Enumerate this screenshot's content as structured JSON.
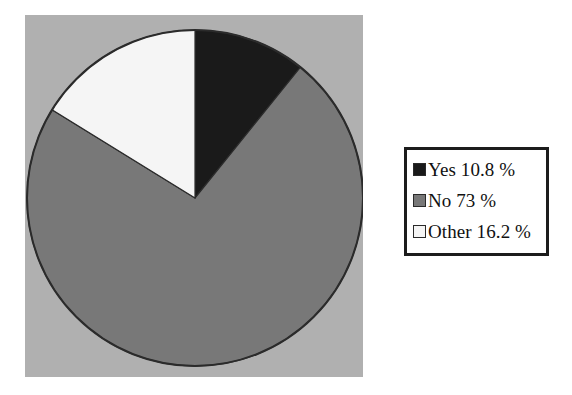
{
  "chart_data": {
    "type": "pie",
    "title": "",
    "subtitle": "",
    "xlabel": "",
    "ylabel": "",
    "grid": false,
    "legend_position": "right",
    "start_angle_deg": 0,
    "direction": "clockwise",
    "categories": [
      "Yes",
      "No",
      "Other"
    ],
    "values": [
      10.8,
      73,
      16.2
    ],
    "value_unit": "%",
    "slices": [
      {
        "label": "Yes",
        "value": 10.8,
        "value_text": "10.8",
        "legend_text": "Yes 10.8 %",
        "color": "#1a1a1a",
        "angle_deg": 38.9
      },
      {
        "label": "No",
        "value": 73,
        "value_text": "73",
        "legend_text": "No 73 %",
        "color": "#787878",
        "angle_deg": 262.8
      },
      {
        "label": "Other",
        "value": 16.2,
        "value_text": "16.2",
        "legend_text": "Other 16.2 %",
        "color": "#f5f5f5",
        "angle_deg": 58.3
      }
    ]
  },
  "plot": {
    "background_color": "#b0b0b0",
    "pie_outline_color": "#2b2b2b"
  },
  "legend": {
    "border_color": "#1c1c1c",
    "background_color": "#ffffff",
    "rows": [
      {
        "swatch_color": "#1a1a1a",
        "text": "Yes 10.8 %"
      },
      {
        "swatch_color": "#787878",
        "text": "No 73 %"
      },
      {
        "swatch_color": "#f5f5f5",
        "text": "Other 16.2 %"
      }
    ]
  }
}
